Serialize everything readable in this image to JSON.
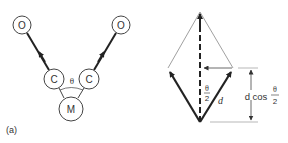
{
  "panel_a": {
    "label": "(a)",
    "atoms": {
      "o_left": "O",
      "o_right": "O",
      "c_left": "C",
      "c_right": "C",
      "metal": "M"
    },
    "angle_label": "θ"
  },
  "vector_diagram": {
    "half_angle_num": "θ",
    "half_angle_den": "2",
    "vector_label": "d",
    "projection_label_prefix": "d cos",
    "projection_frac_num": "θ",
    "projection_frac_den": "2"
  },
  "colors": {
    "stroke": "#333333",
    "thin": "#777777",
    "background": "#ffffff"
  }
}
